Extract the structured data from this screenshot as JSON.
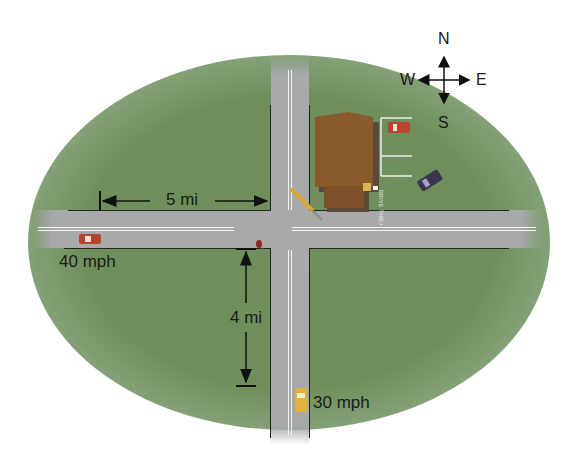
{
  "diagram": {
    "type": "intersection-map",
    "compass": {
      "north": "N",
      "south": "S",
      "east": "E",
      "west": "W"
    },
    "measurements": {
      "horizontal_distance": "5 mi",
      "vertical_distance": "4 mi"
    },
    "vehicles": {
      "west_car_speed": "40 mph",
      "south_car_speed": "30 mph"
    },
    "building": {
      "drive_thru_label": "DRIVE THRU"
    },
    "colors": {
      "grass": "#6f8f5c",
      "road": "#a7a9ab",
      "building_roof": "#8a5a2b",
      "red_car": "#b5452f",
      "yellow_car": "#e0b23a",
      "dark_car": "#3a3550"
    }
  }
}
